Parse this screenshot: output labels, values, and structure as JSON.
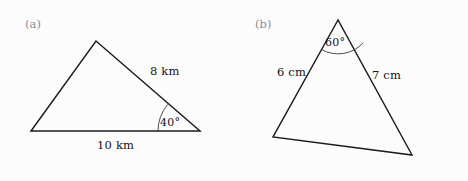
{
  "figure": {
    "background_color": "#fcfcfc",
    "stroke_color": "#1b1b1b",
    "label_color": "#8e8e8e",
    "text_color": "#141414",
    "width": 468,
    "height": 181
  },
  "panels": [
    {
      "id": "a",
      "tag": "(a)",
      "shape": "triangle",
      "vertices": [
        {
          "name": "bottom-left",
          "x": 31,
          "y": 131
        },
        {
          "name": "apex",
          "x": 96,
          "y": 41
        },
        {
          "name": "bottom-right",
          "x": 200,
          "y": 131
        }
      ],
      "side_labels": [
        {
          "name": "right-side",
          "text": "8 km"
        },
        {
          "name": "base",
          "text": "10 km"
        }
      ],
      "angle_labels": [
        {
          "name": "bottom-right-angle",
          "text": "40°",
          "value": 40,
          "unit": "degrees"
        }
      ]
    },
    {
      "id": "b",
      "tag": "(b)",
      "shape": "triangle",
      "vertices": [
        {
          "name": "apex",
          "x": 104,
          "y": 20
        },
        {
          "name": "bottom-left",
          "x": 39,
          "y": 137
        },
        {
          "name": "bottom-right",
          "x": 178,
          "y": 155
        }
      ],
      "side_labels": [
        {
          "name": "left-side",
          "text": "6 cm"
        },
        {
          "name": "right-side",
          "text": "7 cm"
        }
      ],
      "angle_labels": [
        {
          "name": "apex-angle",
          "text": "60°",
          "value": 60,
          "unit": "degrees"
        }
      ]
    }
  ]
}
